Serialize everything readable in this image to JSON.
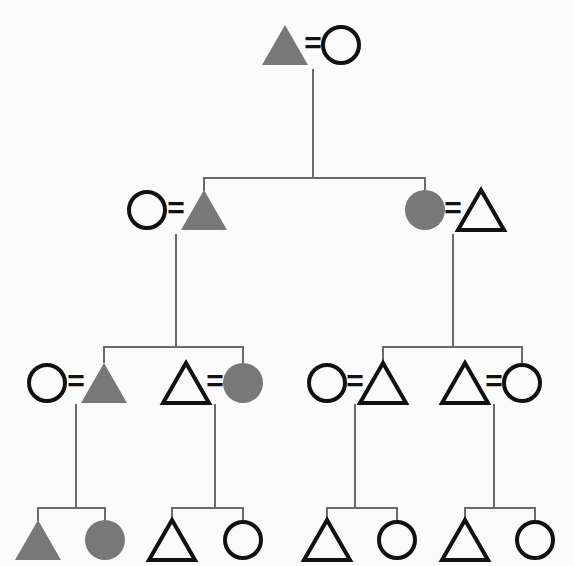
{
  "figure": {
    "kind": "pedigree-chart",
    "width": 574,
    "height": 566,
    "background_color": "#fbfbfb",
    "generations": 4
  },
  "style": {
    "filled_color": "#787878",
    "outline_color": "#111111",
    "line_color": "#6a6a6a",
    "shape_stroke_width": 4,
    "line_stroke_width": 2,
    "mating_symbol": "=",
    "triangle_half_width": 23,
    "triangle_height": 40,
    "circle_radius": 20
  },
  "legend": {
    "triangle_meaning": "triangle-symbol",
    "circle_meaning": "circle-symbol",
    "filled_meaning": "filled-affected",
    "open_meaning": "open-unaffected"
  },
  "individuals": [
    {
      "id": "I-1",
      "shape": "triangle",
      "fill": "filled",
      "x": 285,
      "y": 45,
      "generation": 1
    },
    {
      "id": "I-2",
      "shape": "circle",
      "fill": "open",
      "x": 341,
      "y": 45,
      "generation": 1
    },
    {
      "id": "II-1",
      "shape": "circle",
      "fill": "open",
      "x": 147,
      "y": 210,
      "generation": 2
    },
    {
      "id": "II-2",
      "shape": "triangle",
      "fill": "filled",
      "x": 204,
      "y": 210,
      "generation": 2
    },
    {
      "id": "II-3",
      "shape": "circle",
      "fill": "filled",
      "x": 425,
      "y": 210,
      "generation": 2
    },
    {
      "id": "II-4",
      "shape": "triangle",
      "fill": "open",
      "x": 481,
      "y": 210,
      "generation": 2
    },
    {
      "id": "III-1",
      "shape": "circle",
      "fill": "open",
      "x": 47,
      "y": 383,
      "generation": 3
    },
    {
      "id": "III-2",
      "shape": "triangle",
      "fill": "filled",
      "x": 104,
      "y": 383,
      "generation": 3
    },
    {
      "id": "III-3",
      "shape": "triangle",
      "fill": "open",
      "x": 186,
      "y": 383,
      "generation": 3
    },
    {
      "id": "III-4",
      "shape": "circle",
      "fill": "filled",
      "x": 243,
      "y": 383,
      "generation": 3
    },
    {
      "id": "III-5",
      "shape": "circle",
      "fill": "open",
      "x": 327,
      "y": 383,
      "generation": 3
    },
    {
      "id": "III-6",
      "shape": "triangle",
      "fill": "open",
      "x": 383,
      "y": 383,
      "generation": 3
    },
    {
      "id": "III-7",
      "shape": "triangle",
      "fill": "open",
      "x": 465,
      "y": 383,
      "generation": 3
    },
    {
      "id": "III-8",
      "shape": "circle",
      "fill": "open",
      "x": 522,
      "y": 383,
      "generation": 3
    },
    {
      "id": "IV-1",
      "shape": "triangle",
      "fill": "filled",
      "x": 38,
      "y": 540,
      "generation": 4
    },
    {
      "id": "IV-2",
      "shape": "circle",
      "fill": "filled",
      "x": 105,
      "y": 540,
      "generation": 4
    },
    {
      "id": "IV-3",
      "shape": "triangle",
      "fill": "open",
      "x": 172,
      "y": 540,
      "generation": 4
    },
    {
      "id": "IV-4",
      "shape": "circle",
      "fill": "open",
      "x": 243,
      "y": 540,
      "generation": 4
    },
    {
      "id": "IV-5",
      "shape": "triangle",
      "fill": "open",
      "x": 327,
      "y": 540,
      "generation": 4
    },
    {
      "id": "IV-6",
      "shape": "circle",
      "fill": "open",
      "x": 397,
      "y": 540,
      "generation": 4
    },
    {
      "id": "IV-7",
      "shape": "triangle",
      "fill": "open",
      "x": 465,
      "y": 540,
      "generation": 4
    },
    {
      "id": "IV-8",
      "shape": "circle",
      "fill": "open",
      "x": 535,
      "y": 540,
      "generation": 4
    }
  ],
  "matings": [
    {
      "id": "M1",
      "left": "I-1",
      "right": "I-2",
      "symbol_x": 313,
      "symbol_y": 45
    },
    {
      "id": "M2",
      "left": "II-1",
      "right": "II-2",
      "symbol_x": 176,
      "symbol_y": 210
    },
    {
      "id": "M3",
      "left": "II-3",
      "right": "II-4",
      "symbol_x": 453,
      "symbol_y": 210
    },
    {
      "id": "M4",
      "left": "III-1",
      "right": "III-2",
      "symbol_x": 76,
      "symbol_y": 383
    },
    {
      "id": "M5",
      "left": "III-3",
      "right": "III-4",
      "symbol_x": 215,
      "symbol_y": 383
    },
    {
      "id": "M6",
      "left": "III-5",
      "right": "III-6",
      "symbol_x": 355,
      "symbol_y": 383
    },
    {
      "id": "M7",
      "left": "III-7",
      "right": "III-8",
      "symbol_x": 494,
      "symbol_y": 383
    }
  ],
  "sibships": [
    {
      "id": "S1",
      "from_mating": "M1",
      "drop_x": 313,
      "drop_top": 70,
      "bar_y": 178,
      "children_x": [
        204,
        425
      ],
      "child_top": 190
    },
    {
      "id": "S2",
      "from_mating": "M2",
      "drop_x": 176,
      "drop_top": 235,
      "bar_y": 347,
      "children_x": [
        104,
        243
      ],
      "child_top": 362
    },
    {
      "id": "S3",
      "from_mating": "M3",
      "drop_x": 453,
      "drop_top": 235,
      "bar_y": 347,
      "children_x": [
        383,
        522
      ],
      "child_top": 362
    },
    {
      "id": "S4",
      "from_mating": "M4",
      "drop_x": 76,
      "drop_top": 405,
      "bar_y": 508,
      "children_x": [
        38,
        105
      ],
      "child_top": 520
    },
    {
      "id": "S5",
      "from_mating": "M5",
      "drop_x": 215,
      "drop_top": 405,
      "bar_y": 508,
      "children_x": [
        172,
        243
      ],
      "child_top": 520
    },
    {
      "id": "S6",
      "from_mating": "M6",
      "drop_x": 355,
      "drop_top": 405,
      "bar_y": 508,
      "children_x": [
        327,
        397
      ],
      "child_top": 520
    },
    {
      "id": "S7",
      "from_mating": "M7",
      "drop_x": 494,
      "drop_top": 405,
      "bar_y": 508,
      "children_x": [
        465,
        535
      ],
      "child_top": 520
    }
  ]
}
